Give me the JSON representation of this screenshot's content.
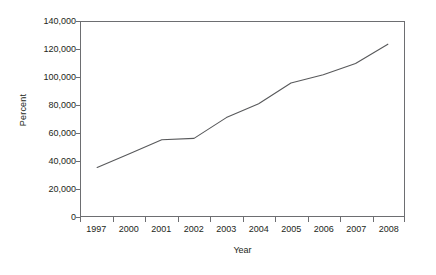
{
  "chart_data": {
    "type": "line",
    "title": "",
    "xlabel": "Year",
    "ylabel": "Percent",
    "categories": [
      "1997",
      "2000",
      "2001",
      "2002",
      "2003",
      "2004",
      "2005",
      "2006",
      "2007",
      "2008"
    ],
    "values": [
      35000,
      45000,
      55000,
      56000,
      71000,
      81000,
      96000,
      102000,
      110000,
      124000
    ],
    "series": [
      {
        "name": "Percent",
        "values": [
          35000,
          45000,
          55000,
          56000,
          71000,
          81000,
          96000,
          102000,
          110000,
          124000
        ]
      }
    ],
    "ylim": [
      0,
      140000
    ],
    "yticks": [
      0,
      20000,
      40000,
      60000,
      80000,
      100000,
      120000,
      140000
    ],
    "ytick_labels": [
      "0",
      "20,000",
      "40,000",
      "60,000",
      "80,000",
      "100,000",
      "120,000",
      "140,000"
    ],
    "xtick_labels": [
      "1997",
      "2000",
      "2001",
      "2002",
      "2003",
      "2004",
      "2005",
      "2006",
      "2007",
      "2008"
    ],
    "grid": false,
    "legend": false,
    "markers": false,
    "line_color": "#58595b",
    "frame_color": "#6d6e71",
    "background": "#ffffff"
  }
}
